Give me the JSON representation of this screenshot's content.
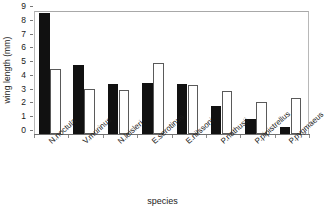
{
  "chart_data": {
    "type": "bar",
    "title": "",
    "subtitle": "",
    "xlabel": "species",
    "ylabel": "wing length (mm)",
    "ylim": [
      0,
      9
    ],
    "yticks": [
      0,
      1,
      2,
      3,
      4,
      5,
      6,
      7,
      8,
      9
    ],
    "ytick_labels": [
      "0",
      "1",
      "2",
      "3",
      "4",
      "5",
      "6",
      "7",
      "8",
      "9"
    ],
    "grid": false,
    "legend": false,
    "legend_position": "none",
    "orientation": "vertical",
    "grouped": true,
    "categories": [
      "N.noctula",
      "V.murinus",
      "N.leisleri",
      "E.serotinus",
      "E.nilssoni",
      "P.nathusii",
      "P.pipistrellus",
      "P.pygmaeus"
    ],
    "series": [
      {
        "name": "series-1-filled",
        "color": "#111111",
        "fill": "solid-black",
        "values": [
          8.75,
          4.95,
          3.6,
          3.65,
          3.6,
          2.0,
          1.05,
          0.5
        ]
      },
      {
        "name": "series-2-open",
        "color": "#ffffff",
        "fill": "white-outlined",
        "values": [
          4.65,
          3.2,
          3.15,
          5.15,
          3.55,
          3.05,
          2.3,
          2.55
        ]
      }
    ]
  },
  "colors": {
    "series_filled": "#111111",
    "series_open": "#ffffff",
    "series_open_edge": "#5a5a5a",
    "axis": "#6f6f6f",
    "frame": "#b8b8b8",
    "text": "#1a1a1a",
    "background": "#ffffff"
  }
}
